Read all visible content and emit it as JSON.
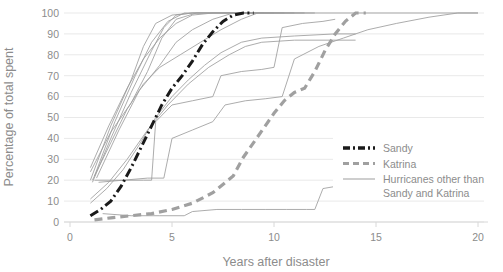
{
  "chart_data": {
    "type": "line",
    "title": "",
    "xlabel": "Years after disaster",
    "ylabel": "Percentage of total spent",
    "xlim": [
      0,
      20
    ],
    "ylim": [
      0,
      100
    ],
    "xticks": [
      0,
      5,
      10,
      15,
      20
    ],
    "yticks": [
      0,
      10,
      20,
      30,
      40,
      50,
      60,
      70,
      80,
      90,
      100
    ],
    "xtick_labels": [
      "0",
      "5",
      "10",
      "15",
      "20"
    ],
    "ytick_labels": [
      "0",
      "10",
      "20",
      "30",
      "40",
      "50",
      "60",
      "70",
      "80",
      "90",
      "100"
    ],
    "grid": "horizontal",
    "legend_position": "lower-right",
    "colors": {
      "sandy": "#1a1a1a",
      "katrina": "#a0a0a0",
      "other": "#9d9d9d",
      "grid": "#e9e9e9",
      "text": "#8c8c8c"
    },
    "series": [
      {
        "name": "Sandy",
        "style": "dash-dot",
        "color": "#1a1a1a",
        "width": 3,
        "points": [
          [
            1.0,
            3
          ],
          [
            1.5,
            6
          ],
          [
            2.0,
            10
          ],
          [
            2.5,
            17
          ],
          [
            3.0,
            26
          ],
          [
            3.5,
            36
          ],
          [
            4.0,
            46
          ],
          [
            4.5,
            56
          ],
          [
            5.0,
            64
          ],
          [
            5.5,
            70
          ],
          [
            6.0,
            77
          ],
          [
            6.5,
            85
          ],
          [
            7.0,
            91
          ],
          [
            7.5,
            96
          ],
          [
            8.0,
            99
          ],
          [
            8.5,
            100
          ],
          [
            9.0,
            100
          ]
        ]
      },
      {
        "name": "Katrina",
        "style": "dashed",
        "color": "#a0a0a0",
        "width": 3.2,
        "points": [
          [
            1.2,
            1
          ],
          [
            2.0,
            2
          ],
          [
            3.0,
            3
          ],
          [
            4.0,
            4
          ],
          [
            5.0,
            6
          ],
          [
            6.0,
            9
          ],
          [
            7.0,
            14
          ],
          [
            8.0,
            22
          ],
          [
            8.5,
            31
          ],
          [
            9.0,
            38
          ],
          [
            9.5,
            45
          ],
          [
            10.0,
            52
          ],
          [
            10.5,
            58
          ],
          [
            11.0,
            62
          ],
          [
            11.5,
            64
          ],
          [
            12.0,
            72
          ],
          [
            12.5,
            82
          ],
          [
            13.0,
            90
          ],
          [
            13.5,
            96
          ],
          [
            14.0,
            100
          ],
          [
            14.5,
            100
          ]
        ]
      },
      {
        "name": "Hurricanes other than Sandy and Katrina",
        "style": "solid",
        "color": "#9d9d9d",
        "width": 0.85,
        "points": [
          [
            1.0,
            20
          ],
          [
            2.0,
            46
          ],
          [
            3.0,
            68
          ],
          [
            3.6,
            84
          ],
          [
            4.2,
            95
          ],
          [
            5.0,
            99
          ],
          [
            6.0,
            100
          ],
          [
            20.0,
            100
          ]
        ]
      },
      {
        "name": "Hurricanes other than Sandy and Katrina",
        "style": "solid",
        "color": "#9d9d9d",
        "width": 0.85,
        "points": [
          [
            1.1,
            19
          ],
          [
            2.0,
            40
          ],
          [
            3.0,
            62
          ],
          [
            4.0,
            82
          ],
          [
            4.6,
            93
          ],
          [
            5.2,
            99
          ],
          [
            6.0,
            100
          ],
          [
            11.0,
            100
          ]
        ]
      },
      {
        "name": "Hurricanes other than Sandy and Katrina",
        "style": "solid",
        "color": "#9d9d9d",
        "width": 0.85,
        "points": [
          [
            1.2,
            22
          ],
          [
            2.2,
            48
          ],
          [
            3.2,
            70
          ],
          [
            4.0,
            86
          ],
          [
            4.8,
            96
          ],
          [
            5.6,
            100
          ],
          [
            10.5,
            100
          ]
        ]
      },
      {
        "name": "Hurricanes other than Sandy and Katrina",
        "style": "solid",
        "color": "#9d9d9d",
        "width": 0.85,
        "points": [
          [
            1.0,
            24
          ],
          [
            2.0,
            43
          ],
          [
            3.0,
            57
          ],
          [
            3.8,
            72
          ],
          [
            4.5,
            88
          ],
          [
            5.2,
            97
          ],
          [
            6.2,
            100
          ],
          [
            9.5,
            100
          ]
        ]
      },
      {
        "name": "Hurricanes other than Sandy and Katrina",
        "style": "solid",
        "color": "#9d9d9d",
        "width": 0.85,
        "points": [
          [
            1.3,
            21
          ],
          [
            2.4,
            44
          ],
          [
            3.4,
            63
          ],
          [
            4.4,
            75
          ],
          [
            5.2,
            86
          ],
          [
            6.0,
            92
          ],
          [
            7.0,
            97
          ],
          [
            8.0,
            100
          ],
          [
            11.5,
            100
          ]
        ]
      },
      {
        "name": "Hurricanes other than Sandy and Katrina",
        "style": "solid",
        "color": "#9d9d9d",
        "width": 0.85,
        "points": [
          [
            1.1,
            20
          ],
          [
            2.0,
            38
          ],
          [
            2.8,
            54
          ],
          [
            3.6,
            66
          ],
          [
            4.4,
            74
          ],
          [
            5.4,
            80
          ],
          [
            6.4,
            86
          ],
          [
            7.4,
            92
          ],
          [
            8.4,
            97
          ],
          [
            9.2,
            100
          ],
          [
            12.0,
            100
          ]
        ]
      },
      {
        "name": "Hurricanes other than Sandy and Katrina",
        "style": "solid",
        "color": "#9d9d9d",
        "width": 0.85,
        "points": [
          [
            1.0,
            9
          ],
          [
            1.8,
            16
          ],
          [
            2.6,
            25
          ],
          [
            3.4,
            37
          ],
          [
            4.2,
            50
          ],
          [
            5.0,
            60
          ],
          [
            5.8,
            68
          ],
          [
            6.6,
            75
          ],
          [
            7.4,
            81
          ],
          [
            8.4,
            86
          ],
          [
            9.4,
            88
          ],
          [
            11.0,
            89
          ],
          [
            13.0,
            90
          ],
          [
            14.0,
            90
          ]
        ]
      },
      {
        "name": "Hurricanes other than Sandy and Katrina",
        "style": "solid",
        "color": "#9d9d9d",
        "width": 0.85,
        "points": [
          [
            1.0,
            11
          ],
          [
            1.9,
            19
          ],
          [
            2.8,
            30
          ],
          [
            3.8,
            44
          ],
          [
            4.8,
            56
          ],
          [
            5.8,
            66
          ],
          [
            6.8,
            74
          ],
          [
            7.8,
            80
          ],
          [
            8.6,
            84
          ],
          [
            9.4,
            86
          ],
          [
            11.0,
            87
          ],
          [
            13.0,
            87
          ],
          [
            14.0,
            87
          ]
        ]
      },
      {
        "name": "Hurricanes other than Sandy and Katrina",
        "style": "solid",
        "color": "#9d9d9d",
        "width": 0.85,
        "points": [
          [
            1.2,
            20
          ],
          [
            2.4,
            20
          ],
          [
            3.6,
            20
          ],
          [
            4.0,
            20
          ],
          [
            4.2,
            48
          ],
          [
            5.0,
            56
          ],
          [
            6.0,
            58
          ],
          [
            7.0,
            60
          ],
          [
            7.4,
            70
          ],
          [
            8.4,
            72
          ],
          [
            9.4,
            73
          ],
          [
            10.0,
            74
          ],
          [
            10.4,
            93
          ],
          [
            11.4,
            95
          ],
          [
            12.4,
            96
          ],
          [
            13.0,
            97
          ]
        ]
      },
      {
        "name": "Hurricanes other than Sandy and Katrina",
        "style": "solid",
        "color": "#9d9d9d",
        "width": 0.85,
        "points": [
          [
            1.4,
            19
          ],
          [
            2.6,
            20
          ],
          [
            3.8,
            21
          ],
          [
            4.6,
            21
          ],
          [
            5.0,
            40
          ],
          [
            6.0,
            44
          ],
          [
            7.0,
            48
          ],
          [
            7.6,
            56
          ],
          [
            8.6,
            58
          ],
          [
            9.6,
            59
          ],
          [
            10.4,
            60
          ],
          [
            11.0,
            78
          ],
          [
            12.2,
            84
          ],
          [
            13.4,
            88
          ],
          [
            14.6,
            92
          ],
          [
            16.0,
            95
          ],
          [
            17.6,
            98
          ],
          [
            19.0,
            100
          ],
          [
            20.0,
            100
          ]
        ]
      },
      {
        "name": "Hurricanes other than Sandy and Katrina",
        "style": "solid",
        "color": "#9d9d9d",
        "width": 0.85,
        "points": [
          [
            1.6,
            4
          ],
          [
            3.0,
            3
          ],
          [
            4.4,
            3
          ],
          [
            5.6,
            3
          ],
          [
            6.0,
            5
          ],
          [
            7.2,
            6
          ],
          [
            8.4,
            6
          ],
          [
            9.6,
            6
          ],
          [
            10.6,
            6
          ],
          [
            11.6,
            6
          ],
          [
            12.0,
            6
          ],
          [
            12.4,
            16
          ],
          [
            13.6,
            18
          ],
          [
            15.0,
            18
          ],
          [
            16.4,
            18
          ],
          [
            18.0,
            18
          ],
          [
            19.4,
            18
          ]
        ]
      },
      {
        "name": "Hurricanes other than Sandy and Katrina",
        "style": "solid",
        "color": "#9d9d9d",
        "width": 0.85,
        "points": [
          [
            1.0,
            26
          ],
          [
            1.9,
            46
          ],
          [
            2.8,
            64
          ],
          [
            3.6,
            78
          ],
          [
            4.4,
            88
          ],
          [
            5.2,
            95
          ],
          [
            6.0,
            99
          ],
          [
            7.0,
            100
          ],
          [
            10.0,
            100
          ]
        ]
      }
    ],
    "legend": [
      {
        "label": "Sandy",
        "style": "dash-dot",
        "color": "#1a1a1a"
      },
      {
        "label": "Katrina",
        "style": "dashed",
        "color": "#a0a0a0"
      },
      {
        "label": "Hurricanes other than",
        "label2": "Sandy and Katrina",
        "style": "solid",
        "color": "#9d9d9d"
      }
    ]
  }
}
